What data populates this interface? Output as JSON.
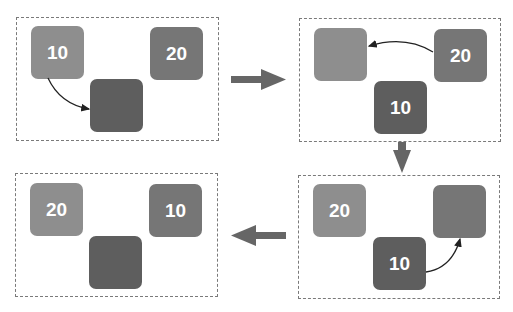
{
  "diagram": {
    "colors": {
      "slot_a": "#8e8e8e",
      "slot_b": "#767676",
      "slot_temp": "#5e5e5e",
      "arrow": "#666666",
      "border": "#7a7a7a",
      "text": "#ffffff"
    },
    "steps": [
      {
        "id": "step1",
        "slots": {
          "a": "10",
          "b": "20",
          "temp": ""
        },
        "move": "a -> temp"
      },
      {
        "id": "step2",
        "slots": {
          "a": "",
          "b": "20",
          "temp": "10"
        },
        "move": "b -> a"
      },
      {
        "id": "step3",
        "slots": {
          "a": "20",
          "b": "",
          "temp": "10"
        },
        "move": "temp -> b"
      },
      {
        "id": "step4",
        "slots": {
          "a": "20",
          "b": "10",
          "temp": ""
        },
        "move": ""
      }
    ],
    "flow": [
      "right",
      "down",
      "left"
    ]
  }
}
